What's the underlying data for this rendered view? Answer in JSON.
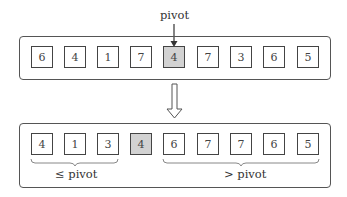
{
  "diagram": {
    "title_label": "pivot",
    "before": {
      "values": [
        "6",
        "4",
        "1",
        "7",
        "4",
        "7",
        "3",
        "6",
        "5"
      ],
      "pivot_index": 4
    },
    "after": {
      "values": [
        "4",
        "1",
        "3",
        "4",
        "6",
        "7",
        "7",
        "6",
        "5"
      ],
      "pivot_index": 3
    },
    "groups": {
      "left_label": "≤ pivot",
      "right_label": "> pivot"
    },
    "colors": {
      "pivot_fill": "#d2d2d2",
      "cell_fill": "#ffffff",
      "stroke": "#444444"
    }
  }
}
